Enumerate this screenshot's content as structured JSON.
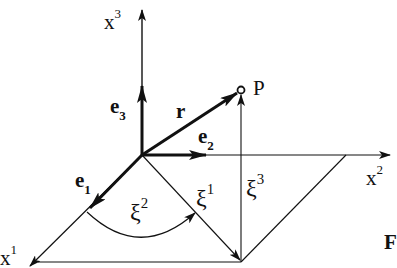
{
  "figure": {
    "type": "coordinate-system-diagram",
    "labels": {
      "x1": {
        "base": "x",
        "sup": "1"
      },
      "x2": {
        "base": "x",
        "sup": "2"
      },
      "x3": {
        "base": "x",
        "sup": "3"
      },
      "e1": {
        "base": "e",
        "sub": "1"
      },
      "e2": {
        "base": "e",
        "sub": "2"
      },
      "e3": {
        "base": "e",
        "sub": "3"
      },
      "r": "r",
      "P": "P",
      "xi1": {
        "base": "ξ",
        "sup": "1"
      },
      "xi2": {
        "base": "ξ",
        "sup": "2"
      },
      "xi3": {
        "base": "ξ",
        "sup": "3"
      },
      "cut_off_text": "F"
    },
    "colors": {
      "ink": "#111111",
      "background": "#ffffff"
    }
  }
}
